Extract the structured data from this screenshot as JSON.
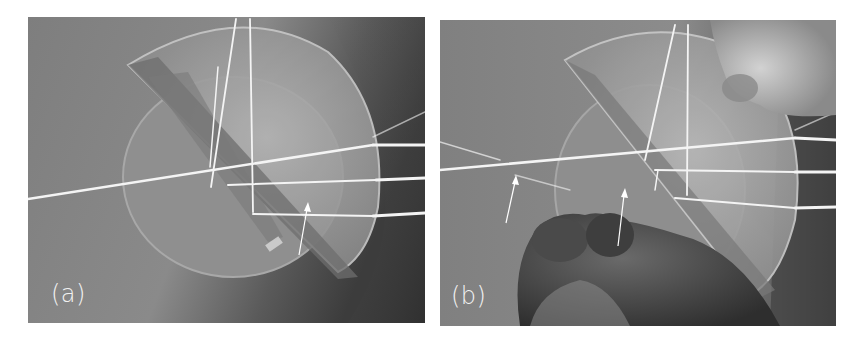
{
  "figure": {
    "panels": [
      {
        "id": "a",
        "label": "(a)",
        "description": "Light beams refracted through semicircular and half-disk glass lenses; arrow marks a faint reflected beam"
      },
      {
        "id": "b",
        "label": "(b)",
        "description": "Same setup with lens rotated and held by hand; two arrows mark faint reflected beams"
      }
    ],
    "colors": {
      "background": "#7a7a7a",
      "beam": "#f4f4f4",
      "lens_highlight": "#bdbdbd",
      "shadow": "#3a3a3a",
      "label": "#f2f2f2",
      "arrow": "#ffffff"
    }
  }
}
